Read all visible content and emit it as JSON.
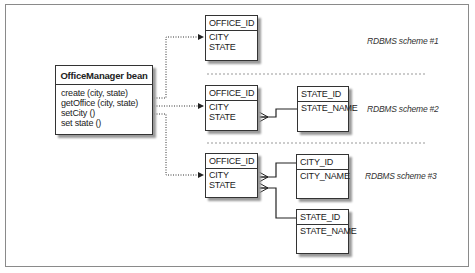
{
  "bean": {
    "title": "OfficeManager bean",
    "methods": [
      "create (city, state)",
      "getOffice (city, state)",
      "setCity ()",
      "set state ()"
    ]
  },
  "schemes": [
    {
      "label": "RDBMS scheme #1",
      "tables": [
        {
          "key": "OFFICE_ID",
          "fields": [
            "CITY",
            "STATE"
          ]
        }
      ]
    },
    {
      "label": "RDBMS scheme #2",
      "tables": [
        {
          "key": "OFFICE_ID",
          "fields": [
            "CITY",
            "STATE"
          ]
        },
        {
          "key": "STATE_ID",
          "fields": [
            "STATE_NAME"
          ]
        }
      ]
    },
    {
      "label": "RDBMS scheme #3",
      "tables": [
        {
          "key": "OFFICE_ID",
          "fields": [
            "CITY",
            "STATE"
          ]
        },
        {
          "key": "CITY_ID",
          "fields": [
            "CITY_NAME"
          ]
        },
        {
          "key": "STATE_ID",
          "fields": [
            "STATE_NAME"
          ]
        }
      ]
    }
  ],
  "colors": {
    "line": "#333333",
    "frame": "#8a8a8a",
    "separator": "#999999",
    "shadow": "#9a9a9a"
  }
}
